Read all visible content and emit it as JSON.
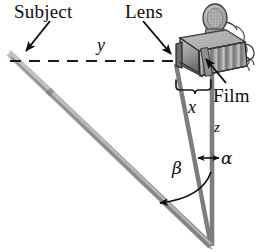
{
  "figure": {
    "type": "optics-schematic",
    "width": 262,
    "height": 252
  },
  "labels": {
    "subject": "Subject",
    "lens": "Lens",
    "film": "Film",
    "distance_y": "y",
    "distance_x": "x",
    "distance_z": "z",
    "angle_alpha": "α",
    "angle_beta": "β"
  },
  "colors": {
    "background": "#ffffff",
    "text": "#0d0d0d",
    "ray_line": "#7d7d7d",
    "subject_bar": "#a9a9a9",
    "subject_bar_dark": "#8e8e8e",
    "dashed_axis": "#1a1a1a",
    "camera_body": "#8c8c8c",
    "camera_body_light": "#b5b5b5",
    "camera_body_dark": "#5e5e5e",
    "camera_outline": "#2b2b2b"
  },
  "geometry": {
    "vertex": {
      "x": 212,
      "y": 245
    },
    "lens_point": {
      "x": 176,
      "y": 64
    },
    "film_point": {
      "x": 212,
      "y": 64
    },
    "subject_top": {
      "x": 9,
      "y": 54
    },
    "dashed_axis_y": 61,
    "dashed_axis_x_start": 10,
    "dashed_axis_x_end": 205,
    "brace": {
      "left": 176,
      "right": 210,
      "y": 80
    }
  },
  "annotations": {
    "subject_arrow": {
      "from": {
        "x": 48,
        "y": 22
      },
      "to": {
        "x": 25,
        "y": 52
      }
    },
    "lens_arrow": {
      "from": {
        "x": 144,
        "y": 22
      },
      "to": {
        "x": 172,
        "y": 55
      }
    },
    "film_arrow": {
      "from": {
        "x": 224,
        "y": 82
      },
      "to": {
        "x": 205,
        "y": 58
      }
    },
    "alpha_arrow": {
      "from": {
        "x": 218,
        "y": 158
      },
      "to": {
        "x": 197,
        "y": 158
      }
    },
    "beta_arc": {
      "from": {
        "x": 210,
        "y": 176
      },
      "to": {
        "x": 158,
        "y": 203
      }
    }
  }
}
